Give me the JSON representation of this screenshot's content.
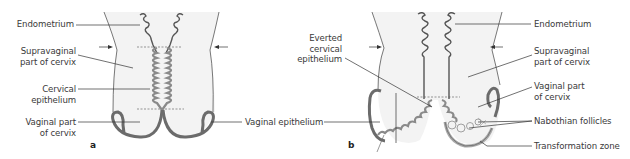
{
  "figure": {
    "panels": [
      {
        "id": "a",
        "letter": "a",
        "labels": {
          "endometrium": "Endometrium",
          "supravaginal_1": "Supravaginal",
          "supravaginal_2": "part of cervix",
          "cervical_epi_1": "Cervical",
          "cervical_epi_2": "epithelium",
          "vaginal_part_1": "Vaginal part",
          "vaginal_part_2": "of cervix"
        }
      },
      {
        "id": "b",
        "letter": "b",
        "labels": {
          "everted_1": "Everted",
          "everted_2": "cervical",
          "everted_3": "epithelium",
          "vaginal_epithelium": "Vaginal epithelium",
          "endometrium": "Endometrium",
          "supravaginal_1": "Supravaginal",
          "supravaginal_2": "part of cervix",
          "vaginal_part_1": "Vaginal part",
          "vaginal_part_2": "of cervix",
          "nabothian": "Nabothian follicles",
          "transformation_zone": "Transformation zone"
        }
      }
    ],
    "colors": {
      "background": "#ffffff",
      "tissue_fill": "#f3f3f3",
      "outline": "#555555",
      "vaginal_wall": "#6b6b6b",
      "epithelium": "#8a8a8a",
      "leader_line": "#333333",
      "text": "#3a3a3a"
    }
  }
}
